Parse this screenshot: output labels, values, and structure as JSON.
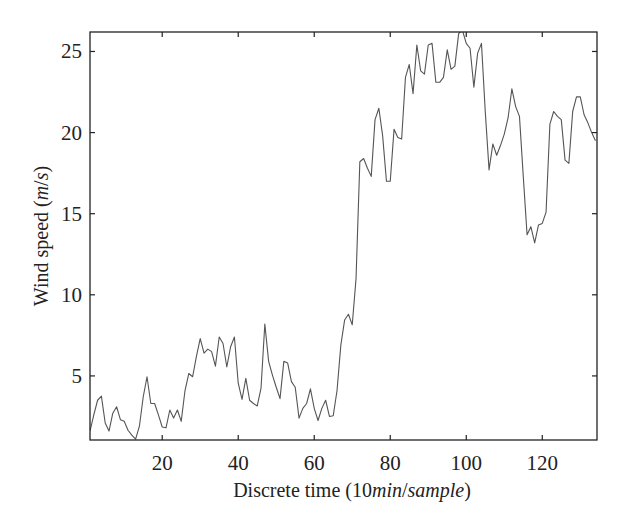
{
  "chart_data": {
    "type": "line",
    "title": "",
    "xlabel": "Discrete time (10min/sample)",
    "xlabel_parts": [
      {
        "text": "Discrete time (10",
        "italic": false
      },
      {
        "text": "min",
        "italic": true
      },
      {
        "text": "/",
        "italic": false
      },
      {
        "text": "sample",
        "italic": true
      },
      {
        "text": ")",
        "italic": false
      }
    ],
    "ylabel": "Wind speed (m/s)",
    "ylabel_parts": [
      {
        "text": "Wind speed (",
        "italic": false
      },
      {
        "text": "m",
        "italic": true
      },
      {
        "text": "/",
        "italic": false
      },
      {
        "text": "s",
        "italic": true
      },
      {
        "text": ")",
        "italic": false
      }
    ],
    "xlim": [
      1,
      134.4
    ],
    "ylim": [
      1.05,
      26.2
    ],
    "xticks": [
      20,
      40,
      60,
      80,
      100,
      120
    ],
    "yticks": [
      5,
      10,
      15,
      20,
      25
    ],
    "grid": false,
    "legend": null,
    "line_color": "#555555",
    "series": [
      {
        "name": "Wind speed",
        "x": [
          1,
          2,
          3,
          4,
          5,
          6,
          7,
          8,
          9,
          10,
          11,
          12,
          13,
          14,
          15,
          16,
          17,
          18,
          19,
          20,
          21,
          22,
          23,
          24,
          25,
          26,
          27,
          28,
          29,
          30,
          31,
          32,
          33,
          34,
          35,
          36,
          37,
          38,
          39,
          40,
          41,
          42,
          43,
          44,
          45,
          46,
          47,
          48,
          49,
          50,
          51,
          52,
          53,
          54,
          55,
          56,
          57,
          58,
          59,
          60,
          61,
          62,
          63,
          64,
          65,
          66,
          67,
          68,
          69,
          70,
          71,
          72,
          73,
          74,
          75,
          76,
          77,
          78,
          79,
          80,
          81,
          82,
          83,
          84,
          85,
          86,
          87,
          88,
          89,
          90,
          91,
          92,
          93,
          94,
          95,
          96,
          97,
          98,
          99,
          100,
          101,
          102,
          103,
          104,
          105,
          106,
          107,
          108,
          109,
          110,
          111,
          112,
          113,
          114,
          115,
          116,
          117,
          118,
          119,
          120,
          121,
          122,
          123,
          124,
          125,
          126,
          127,
          128,
          129,
          130,
          131,
          132,
          133,
          134
        ],
        "values": [
          1.6,
          2.6,
          3.5,
          3.75,
          2.1,
          1.6,
          2.7,
          3.1,
          2.3,
          2.2,
          1.65,
          1.35,
          1.1,
          1.9,
          3.7,
          4.95,
          3.3,
          3.3,
          2.6,
          1.85,
          1.8,
          2.9,
          2.4,
          2.9,
          2.2,
          4.1,
          5.15,
          4.95,
          6.2,
          7.3,
          6.4,
          6.65,
          6.5,
          5.6,
          7.4,
          7.0,
          5.55,
          6.8,
          7.4,
          4.55,
          3.55,
          4.85,
          3.5,
          3.3,
          3.15,
          4.25,
          8.2,
          5.9,
          5.05,
          4.3,
          3.6,
          5.9,
          5.8,
          4.65,
          4.3,
          2.4,
          3.0,
          3.3,
          4.2,
          3.0,
          2.25,
          3.0,
          3.5,
          2.5,
          2.55,
          4.1,
          6.9,
          8.45,
          8.8,
          8.15,
          11.0,
          18.2,
          18.4,
          17.8,
          17.3,
          20.8,
          21.5,
          19.8,
          17.0,
          17.0,
          20.2,
          19.7,
          19.6,
          23.4,
          24.2,
          22.4,
          25.4,
          23.8,
          23.6,
          25.4,
          25.5,
          23.1,
          23.1,
          23.4,
          25.1,
          23.9,
          24.1,
          26.1,
          26.3,
          25.5,
          25.2,
          22.8,
          24.9,
          25.5,
          21.3,
          17.7,
          19.3,
          18.6,
          19.2,
          19.9,
          20.9,
          22.7,
          21.6,
          21.0,
          17.3,
          13.7,
          14.2,
          13.2,
          14.3,
          14.4,
          15.1,
          20.5,
          21.3,
          21.0,
          20.8,
          18.3,
          18.1,
          21.3,
          22.2,
          22.2,
          21.1,
          20.6,
          20.0,
          19.5
        ]
      }
    ]
  }
}
